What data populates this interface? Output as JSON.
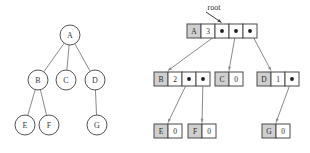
{
  "figure": {
    "title": "",
    "left_diagram": {
      "name": "generic-tree",
      "nodes": [
        {
          "id": "A",
          "label": "A",
          "cx": 70,
          "cy": 35,
          "r": 10
        },
        {
          "id": "B",
          "label": "B",
          "cx": 38,
          "cy": 80,
          "r": 10
        },
        {
          "id": "C",
          "label": "C",
          "cx": 66,
          "cy": 80,
          "r": 10
        },
        {
          "id": "D",
          "label": "D",
          "cx": 95,
          "cy": 80,
          "r": 10
        },
        {
          "id": "E",
          "label": "E",
          "cx": 25,
          "cy": 125,
          "r": 10
        },
        {
          "id": "F",
          "label": "F",
          "cx": 49,
          "cy": 125,
          "r": 10
        },
        {
          "id": "G",
          "label": "G",
          "cx": 97,
          "cy": 125,
          "r": 10
        }
      ],
      "edges": [
        {
          "from": "A",
          "to": "B"
        },
        {
          "from": "A",
          "to": "C"
        },
        {
          "from": "A",
          "to": "D"
        },
        {
          "from": "B",
          "to": "E"
        },
        {
          "from": "B",
          "to": "F"
        },
        {
          "from": "D",
          "to": "G"
        }
      ]
    },
    "right_diagram": {
      "name": "linked-node-representation",
      "root_label": "root",
      "nodes": [
        {
          "id": "A",
          "key": "A",
          "count": "3",
          "x": 187,
          "y": 24,
          "cell_w": 14,
          "cell_h": 14,
          "pointer_count": 3
        },
        {
          "id": "B",
          "key": "B",
          "count": "2",
          "x": 154,
          "y": 72,
          "cell_w": 14,
          "cell_h": 14,
          "pointer_count": 2
        },
        {
          "id": "C",
          "key": "C",
          "count": "0",
          "x": 215,
          "y": 72,
          "cell_w": 14,
          "cell_h": 14,
          "pointer_count": 0
        },
        {
          "id": "D",
          "key": "D",
          "count": "1",
          "x": 257,
          "y": 72,
          "cell_w": 14,
          "cell_h": 14,
          "pointer_count": 1
        },
        {
          "id": "E",
          "key": "E",
          "count": "0",
          "x": 154,
          "y": 124,
          "cell_w": 14,
          "cell_h": 14,
          "pointer_count": 0
        },
        {
          "id": "F",
          "key": "F",
          "count": "0",
          "x": 188,
          "y": 124,
          "cell_w": 14,
          "cell_h": 14,
          "pointer_count": 0
        },
        {
          "id": "G",
          "key": "G",
          "count": "0",
          "x": 262,
          "y": 124,
          "cell_w": 14,
          "cell_h": 14,
          "pointer_count": 0
        }
      ],
      "links": [
        {
          "from": "A",
          "slot": 0,
          "to": "B"
        },
        {
          "from": "A",
          "slot": 1,
          "to": "C"
        },
        {
          "from": "A",
          "slot": 2,
          "to": "D"
        },
        {
          "from": "B",
          "slot": 0,
          "to": "E"
        },
        {
          "from": "B",
          "slot": 1,
          "to": "F"
        },
        {
          "from": "D",
          "slot": 0,
          "to": "G"
        }
      ]
    },
    "colors": {
      "background": "#ffffff",
      "circle_stroke": "#555555",
      "tree_edge": "#8a8a8a",
      "cell_stroke": "#4a4a4a",
      "cell_shaded_fill": "#cfcfcf",
      "pointer_dot": "#1d1d1d",
      "link_arrow": "#8a8a8a",
      "root_arrow": "#3a3a3a",
      "text": "#2b2b2b"
    }
  }
}
